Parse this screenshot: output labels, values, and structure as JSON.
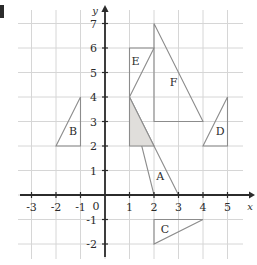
{
  "figure": {
    "title": "",
    "edge_marker": "black-edge-bar"
  },
  "chart_data": {
    "type": "scatter",
    "title": "",
    "xlabel": "x",
    "ylabel": "y",
    "grid": true,
    "legend": "none",
    "xlim": [
      -3.5,
      5.6
    ],
    "ylim": [
      -3.0,
      7.6
    ],
    "xticks": [
      -3,
      -2,
      -1,
      1,
      2,
      3,
      4,
      5
    ],
    "yticks": [
      -2,
      -1,
      1,
      2,
      3,
      4,
      5,
      6,
      7
    ],
    "xtick_labels": [
      "-3",
      "-2",
      "-1",
      "1",
      "2",
      "3",
      "4",
      "5"
    ],
    "ytick_labels": [
      "-2",
      "-1",
      "1",
      "2",
      "3",
      "4",
      "5",
      "6",
      "7"
    ],
    "origin_label": "0",
    "shapes": [
      {
        "label": "A",
        "type": "triangle",
        "vertices": [
          [
            1,
            4
          ],
          [
            3,
            0
          ],
          [
            2,
            0
          ]
        ],
        "label_pos": [
          2.25,
          0.6
        ],
        "fill": "none",
        "stroke": "#8c8c8c"
      },
      {
        "label": "",
        "type": "triangle",
        "name": "shaded-region",
        "vertices": [
          [
            1,
            4
          ],
          [
            1,
            2
          ],
          [
            2,
            2
          ]
        ],
        "label_pos": null,
        "fill": "#e0dedb",
        "stroke": "#8c8c8c"
      },
      {
        "label": "B",
        "type": "triangle",
        "vertices": [
          [
            -1,
            4
          ],
          [
            -1,
            2
          ],
          [
            -2,
            2
          ]
        ],
        "label_pos": [
          -1.3,
          2.45
        ],
        "fill": "none",
        "stroke": "#8c8c8c"
      },
      {
        "label": "C",
        "type": "triangle",
        "vertices": [
          [
            2,
            -1
          ],
          [
            4,
            -1
          ],
          [
            2,
            -2
          ]
        ],
        "label_pos": [
          2.45,
          -1.55
        ],
        "fill": "none",
        "stroke": "#8c8c8c"
      },
      {
        "label": "D",
        "type": "triangle",
        "vertices": [
          [
            5,
            4
          ],
          [
            5,
            2
          ],
          [
            4,
            2
          ]
        ],
        "label_pos": [
          4.7,
          2.45
        ],
        "fill": "none",
        "stroke": "#8c8c8c"
      },
      {
        "label": "E",
        "type": "triangle",
        "vertices": [
          [
            1,
            6
          ],
          [
            2,
            6
          ],
          [
            1,
            4
          ]
        ],
        "label_pos": [
          1.25,
          5.3
        ],
        "fill": "none",
        "stroke": "#8c8c8c"
      },
      {
        "label": "F",
        "type": "triangle",
        "vertices": [
          [
            2,
            7
          ],
          [
            2,
            3
          ],
          [
            4,
            3
          ]
        ],
        "label_pos": [
          2.8,
          4.45
        ],
        "fill": "none",
        "stroke": "#8c8c8c"
      }
    ],
    "colors": {
      "grid": "#d6d6d6",
      "axis": "#2b2b2b",
      "shape_stroke": "#8c8c8c",
      "shape_fill": "#e0dedb",
      "text": "#2b2b2b"
    }
  }
}
